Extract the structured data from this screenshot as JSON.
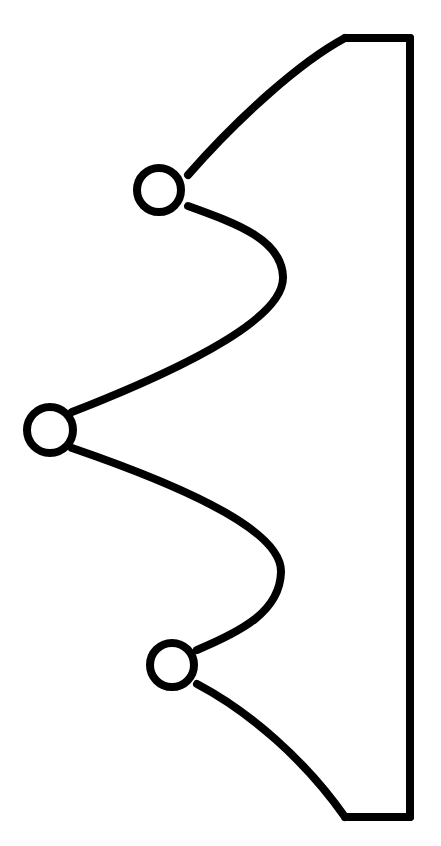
{
  "document": {
    "title": "Line Drawing",
    "description": "Black line-art outline: a vertical bar on the right with three scalloped waves projecting left, each wave terminating in a small open circle",
    "background_color": "#ffffff",
    "ink_color": "#000000"
  },
  "canvas": {
    "width": 441,
    "height": 846
  },
  "figure": {
    "name": "scalloped-bracket-outline",
    "stroke_color": "#000000",
    "stroke_width": 8,
    "fill": "none",
    "linecap": "round",
    "linejoin": "round",
    "bar": {
      "name": "right-vertical-bar",
      "top_edge_y": 38,
      "bottom_edge_y": 817,
      "right_x": 410,
      "left_x_top": 345,
      "left_x_bottom": 345
    },
    "outline_path": "M 410 38 L 345 38 C 300 62 238 118 188 175 M 188 206 C 238 224 282 240 283 277 C 284 315 200 362 72 412 M 72 448 C 200 492 282 534 281 572 C 280 612 240 632 197 650 M 197 684 C 250 712 305 760 345 817 L 410 817",
    "segments": [
      {
        "name": "top-edge",
        "kind": "straight",
        "from": [
          410,
          38
        ],
        "to": [
          345,
          38
        ]
      },
      {
        "name": "upper-outer-sweep",
        "kind": "curve",
        "from": [
          345,
          38
        ],
        "to": [
          188,
          175
        ],
        "control_points": [
          [
            300,
            62
          ],
          [
            238,
            118
          ]
        ]
      },
      {
        "name": "upper-inner-wave",
        "kind": "curve",
        "from": [
          188,
          206
        ],
        "to": [
          72,
          412
        ],
        "control_points": [
          [
            238,
            224
          ],
          [
            282,
            240
          ],
          [
            283,
            277
          ],
          [
            284,
            315
          ],
          [
            200,
            362
          ]
        ],
        "bulge_right_x": 283,
        "bulge_right_y": 277
      },
      {
        "name": "lower-inner-wave",
        "kind": "curve",
        "from": [
          72,
          448
        ],
        "to": [
          197,
          650
        ],
        "control_points": [
          [
            200,
            492
          ],
          [
            282,
            534
          ],
          [
            281,
            572
          ],
          [
            280,
            612
          ],
          [
            240,
            632
          ]
        ],
        "bulge_right_x": 281,
        "bulge_right_y": 572
      },
      {
        "name": "lower-outer-sweep",
        "kind": "curve",
        "from": [
          197,
          684
        ],
        "to": [
          345,
          817
        ],
        "control_points": [
          [
            250,
            712
          ],
          [
            305,
            760
          ]
        ]
      },
      {
        "name": "bottom-edge",
        "kind": "straight",
        "from": [
          345,
          817
        ],
        "to": [
          410,
          817
        ]
      },
      {
        "name": "right-edge",
        "kind": "straight",
        "from": [
          410,
          38
        ],
        "to": [
          410,
          817
        ]
      }
    ],
    "circles": [
      {
        "name": "top-circle",
        "cx": 159,
        "cy": 190,
        "r": 22
      },
      {
        "name": "middle-circle",
        "cx": 50,
        "cy": 430,
        "r": 23
      },
      {
        "name": "bottom-circle",
        "cx": 172,
        "cy": 665,
        "r": 22
      }
    ]
  }
}
